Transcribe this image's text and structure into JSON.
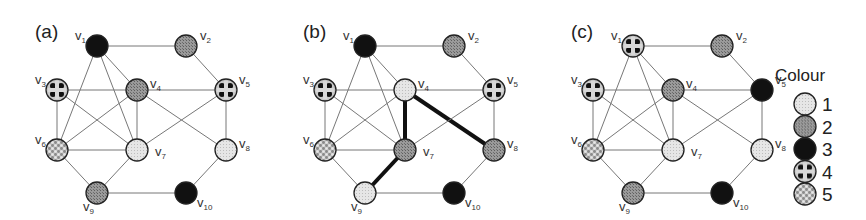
{
  "figure": {
    "panels": [
      {
        "label": "(a)",
        "offset_x": 0,
        "coloring": {
          "v1": 3,
          "v2": 2,
          "v3": 4,
          "v4": 2,
          "v5": 4,
          "v6": 5,
          "v7": 1,
          "v8": 1,
          "v9": 2,
          "v10": 3
        },
        "highlighted_edges": []
      },
      {
        "label": "(b)",
        "offset_x": 268,
        "coloring": {
          "v1": 3,
          "v2": 2,
          "v3": 4,
          "v4": 1,
          "v5": 4,
          "v6": 5,
          "v7": 2,
          "v8": 2,
          "v9": 1,
          "v10": 3
        },
        "highlighted_edges": [
          [
            "v4",
            "v7"
          ],
          [
            "v4",
            "v8"
          ],
          [
            "v7",
            "v9"
          ]
        ]
      },
      {
        "label": "(c)",
        "offset_x": 536,
        "coloring": {
          "v1": 4,
          "v2": 2,
          "v3": 4,
          "v4": 2,
          "v5": 3,
          "v6": 5,
          "v7": 1,
          "v8": 1,
          "v9": 2,
          "v10": 3
        },
        "highlighted_edges": []
      }
    ],
    "vertices": [
      {
        "id": "v1",
        "label": "v",
        "sub": "1",
        "x": 97,
        "y": 46,
        "lx": -22,
        "ly": -6
      },
      {
        "id": "v2",
        "label": "v",
        "sub": "2",
        "x": 186,
        "y": 46,
        "lx": 14,
        "ly": -6
      },
      {
        "id": "v3",
        "label": "v",
        "sub": "3",
        "x": 57,
        "y": 90,
        "lx": -22,
        "ly": -6
      },
      {
        "id": "v4",
        "label": "v",
        "sub": "4",
        "x": 137,
        "y": 90,
        "lx": 13,
        "ly": -2
      },
      {
        "id": "v5",
        "label": "v",
        "sub": "5",
        "x": 226,
        "y": 90,
        "lx": 13,
        "ly": -6
      },
      {
        "id": "v6",
        "label": "v",
        "sub": "6",
        "x": 57,
        "y": 150,
        "lx": -22,
        "ly": -6
      },
      {
        "id": "v7",
        "label": "v",
        "sub": "7",
        "x": 137,
        "y": 150,
        "lx": 18,
        "ly": 6
      },
      {
        "id": "v8",
        "label": "v",
        "sub": "8",
        "x": 226,
        "y": 150,
        "lx": 13,
        "ly": -2
      },
      {
        "id": "v9",
        "label": "v",
        "sub": "9",
        "x": 97,
        "y": 193,
        "lx": -14,
        "ly": 18
      },
      {
        "id": "v10",
        "label": "v",
        "sub": "10",
        "x": 186,
        "y": 193,
        "lx": 11,
        "ly": 14
      }
    ],
    "edges": [
      [
        "v1",
        "v2"
      ],
      [
        "v1",
        "v4"
      ],
      [
        "v1",
        "v6"
      ],
      [
        "v1",
        "v7"
      ],
      [
        "v2",
        "v5"
      ],
      [
        "v3",
        "v4"
      ],
      [
        "v3",
        "v6"
      ],
      [
        "v3",
        "v7"
      ],
      [
        "v4",
        "v5"
      ],
      [
        "v4",
        "v6"
      ],
      [
        "v4",
        "v7"
      ],
      [
        "v4",
        "v8"
      ],
      [
        "v5",
        "v7"
      ],
      [
        "v5",
        "v8"
      ],
      [
        "v6",
        "v7"
      ],
      [
        "v6",
        "v9"
      ],
      [
        "v7",
        "v9"
      ],
      [
        "v8",
        "v10"
      ],
      [
        "v9",
        "v10"
      ]
    ],
    "node_radius": 11
  },
  "legend": {
    "title": "Colour",
    "entries": [
      {
        "value": "1",
        "style": "light",
        "color": "#e2e2e2"
      },
      {
        "value": "2",
        "style": "mid",
        "color": "#8c8c8c"
      },
      {
        "value": "3",
        "style": "black",
        "color": "#111111"
      },
      {
        "value": "4",
        "style": "checker-dark",
        "color": "#555555"
      },
      {
        "value": "5",
        "style": "checker-light",
        "color": "#c8c8c8"
      }
    ]
  },
  "colors": {
    "edge": "#777777",
    "edge_highlight": "#111111",
    "node_stroke": "#222222"
  }
}
